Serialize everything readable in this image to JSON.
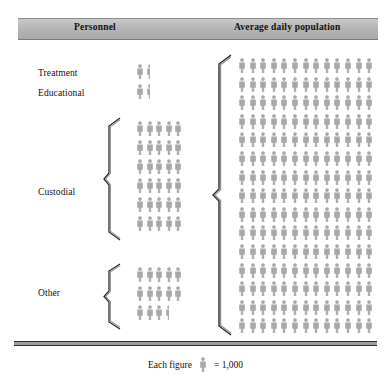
{
  "header": {
    "personnel_label": "Personnel",
    "population_label": "Average daily population"
  },
  "legend": {
    "prefix": "Each figure",
    "equals": "= 1,000",
    "icon": "person-figure-icon",
    "unit_value": 1000
  },
  "colors": {
    "figure": "#a8a8a8",
    "figure_shade": "#949494",
    "header_band": "#b6b6b6",
    "text": "#15110d",
    "rule": "#2f2f2f"
  },
  "chart_data": {
    "type": "pictogram",
    "title": "",
    "xlabel": "",
    "ylabel": "",
    "unit_per_figure": 1000,
    "icon": "person-figure-icon",
    "columns": [
      "Personnel",
      "Average daily population"
    ],
    "categories": [
      "Treatment",
      "Educational",
      "Custodial",
      "Other"
    ],
    "values": [
      1500,
      1500,
      30000,
      13500
    ],
    "figures": [
      1.5,
      1.5,
      30,
      13.5
    ],
    "series": [
      {
        "name": "Personnel",
        "categories": [
          "Treatment",
          "Educational",
          "Custodial",
          "Other"
        ],
        "values": [
          1500,
          1500,
          30000,
          13500
        ],
        "figures": [
          1.5,
          1.5,
          30,
          13.5
        ],
        "rows": [
          {
            "label": "Treatment",
            "full": 1,
            "half": 1,
            "per_row": 5,
            "total_figures": 1.5,
            "value": 1500
          },
          {
            "label": "Educational",
            "full": 1,
            "half": 1,
            "per_row": 5,
            "total_figures": 1.5,
            "value": 1500
          },
          {
            "label": "Custodial",
            "full": 30,
            "half": 0,
            "per_row": 5,
            "total_figures": 30,
            "value": 30000
          },
          {
            "label": "Other",
            "full": 13,
            "half": 1,
            "per_row": 5,
            "total_figures": 13.5,
            "value": 13500
          }
        ]
      },
      {
        "name": "Average daily population",
        "per_row": 13,
        "num_rows": 15,
        "total_figures": 195,
        "value": 195000
      }
    ],
    "legend": "Each figure = 1,000",
    "grid": false
  },
  "left_rows": [
    {
      "label": "Treatment",
      "rows": [
        {
          "full": 1,
          "half": 1
        }
      ]
    },
    {
      "label": "Educational",
      "rows": [
        {
          "full": 1,
          "half": 1
        }
      ]
    },
    {
      "label": "Custodial",
      "rows": [
        {
          "full": 5,
          "half": 0
        },
        {
          "full": 5,
          "half": 0
        },
        {
          "full": 5,
          "half": 0
        },
        {
          "full": 5,
          "half": 0
        },
        {
          "full": 5,
          "half": 0
        },
        {
          "full": 5,
          "half": 0
        }
      ]
    },
    {
      "label": "Other",
      "rows": [
        {
          "full": 5,
          "half": 0
        },
        {
          "full": 5,
          "half": 0
        },
        {
          "full": 3,
          "half": 1
        }
      ]
    }
  ],
  "right_grid": {
    "rows": 15,
    "per_row": 13
  }
}
